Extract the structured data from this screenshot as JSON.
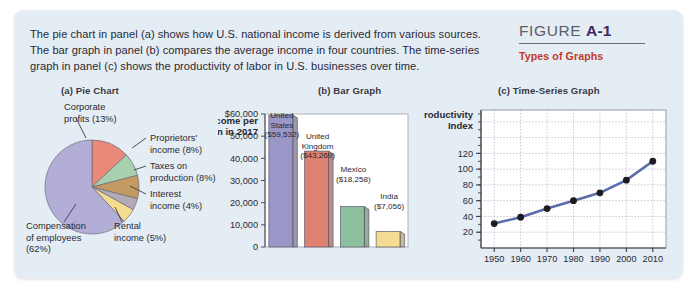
{
  "figure": {
    "label_word": "FIGURE",
    "number": "A-1",
    "subtitle": "Types of Graphs",
    "caption": "The pie chart in panel (a) shows how U.S. national income is derived from various sources. The bar graph in panel (b) compares the average income in four countries. The time-series graph in panel (c) shows the productivity of labor in U.S. businesses over time."
  },
  "panels": {
    "a_heading": "(a) Pie Chart",
    "b_heading": "(b) Bar Graph",
    "c_heading": "(c) Time-Series Graph"
  },
  "colors": {
    "background": "#e4ecf4",
    "accent_red": "#c0392b",
    "figure_number": "#3b2a5a",
    "slice_corporate": "#e8897a",
    "slice_proprietors": "#a8cfae",
    "slice_taxes": "#c49a63",
    "slice_interest": "#b2aab6",
    "slice_rental": "#f5dd8f",
    "slice_compensation": "#b3aed8",
    "bar_us": "#9a96c8",
    "bar_uk": "#e08070",
    "bar_mexico": "#8cbf9c",
    "bar_india": "#f5dc93",
    "line_series": "#5b6ca8",
    "marker": "#1c1c22"
  },
  "chart_data": [
    {
      "type": "pie",
      "title": "(a) Pie Chart",
      "legend_position": "callout-labels",
      "categories": [
        "Corporate profits (13%)",
        "Proprietors' income (8%)",
        "Taxes on production (8%)",
        "Interest income (4%)",
        "Rental income (5%)",
        "Compensation of employees (62%)"
      ],
      "labels": [
        {
          "line1": "Corporate",
          "line2": "profits (13%)",
          "line3": ""
        },
        {
          "line1": "Proprietors'",
          "line2": "income (8%)",
          "line3": ""
        },
        {
          "line1": "Taxes on",
          "line2": "production (8%)",
          "line3": ""
        },
        {
          "line1": "Interest",
          "line2": "income (4%)",
          "line3": ""
        },
        {
          "line1": "Rental",
          "line2": "income (5%)",
          "line3": ""
        },
        {
          "line1": "Compensation",
          "line2": "of employees",
          "line3": "(62%)"
        }
      ],
      "values": [
        13,
        8,
        8,
        4,
        5,
        62
      ],
      "slice_colors": [
        "#e8897a",
        "#a8cfae",
        "#c49a63",
        "#b2aab6",
        "#f5dd8f",
        "#b3aed8"
      ]
    },
    {
      "type": "bar",
      "title": "(b) Bar Graph",
      "ylabel_line1": "Income per",
      "ylabel_line2": "Person in 2017",
      "xlabel": "",
      "categories": [
        "United States",
        "United Kingdom",
        "Mexico",
        "India"
      ],
      "category_lines": [
        [
          "United",
          "States"
        ],
        [
          "United",
          "Kingdom"
        ],
        [
          "Mexico"
        ],
        [
          "India"
        ]
      ],
      "values": [
        59532,
        43269,
        18258,
        7056
      ],
      "value_labels": [
        "($59,532)",
        "($43,269)",
        "($18,258)",
        "($7,056)"
      ],
      "bar_colors": [
        "#9a96c8",
        "#e08070",
        "#8cbf9c",
        "#f5dc93"
      ],
      "ytick_labels": [
        "$60,000",
        "50,000",
        "40,000",
        "30,000",
        "20,000",
        "10,000",
        "0"
      ],
      "yticks": [
        60000,
        50000,
        40000,
        30000,
        20000,
        10000,
        0
      ],
      "ylim": [
        0,
        60000
      ],
      "grid": false
    },
    {
      "type": "line",
      "title": "(c) Time-Series Graph",
      "ylabel_line1": "Productivity",
      "ylabel_line2": "Index",
      "xlabel": "",
      "x": [
        1950,
        1960,
        1970,
        1980,
        1990,
        2000,
        2010
      ],
      "xtick_labels": [
        "1950",
        "1960",
        "1970",
        "1980",
        "1990",
        "2000",
        "2010"
      ],
      "values": [
        31,
        39,
        50,
        60,
        70,
        86,
        110
      ],
      "ytick_labels": [
        "20",
        "40",
        "60",
        "80",
        "100",
        "120"
      ],
      "yticks": [
        20,
        40,
        60,
        80,
        100,
        120
      ],
      "ylim": [
        0,
        175
      ],
      "xlim": [
        1945,
        2015
      ],
      "grid": true,
      "series_color": "#5b6ca8",
      "marker_color": "#1c1c22"
    }
  ]
}
